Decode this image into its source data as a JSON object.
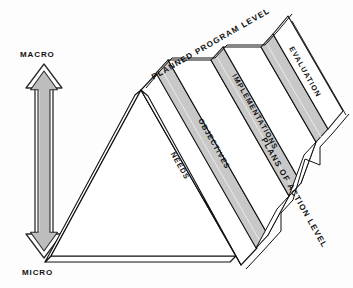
{
  "figure": {
    "background_color": "#fdfdfd",
    "line_color": "#111111",
    "shade_color": "#c8c8c8",
    "face_color": "#ffffff"
  },
  "axis": {
    "top_label": "MACRO",
    "bottom_label": "MICRO",
    "arrow_name": "macro-micro-double-arrow",
    "arrow_fill": "#bdbdbd"
  },
  "levels": {
    "top": "PLANNED PROGRAM LEVEL",
    "right": "PLANS OF ACTION LEVEL"
  },
  "slabs": [
    {
      "id": "needs",
      "label": "NEEDS"
    },
    {
      "id": "objectives",
      "label": "OBJECTIVES"
    },
    {
      "id": "implementations",
      "label": "IMPLEMENTATIONS"
    },
    {
      "id": "evaluation",
      "label": "EVALUATION"
    }
  ]
}
